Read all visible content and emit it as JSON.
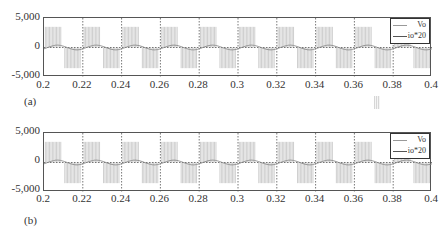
{
  "chart_data": [
    {
      "panel_label": "(a)",
      "type": "line",
      "title": "",
      "xlabel": "",
      "ylabel": "",
      "xlim": [
        0.2,
        0.4
      ],
      "ylim": [
        -5000,
        5000
      ],
      "x_ticks": [
        "0.2",
        "0.22",
        "0.24",
        "0.26",
        "0.28",
        "0.3",
        "0.32",
        "0.34",
        "0.36",
        "0.38",
        "0.4"
      ],
      "y_ticks": [
        "5,000",
        "0",
        "-5,000"
      ],
      "grid": "dotted vertical at each x tick, dotted horizontal at 0",
      "legend": [
        "Vo",
        "io*20"
      ],
      "legend_position": "top-right",
      "series": [
        {
          "name": "Vo",
          "description": "PWM square wave, period 0.02 s, +3500 for first half, -3500 for second half",
          "x": [
            0.2,
            0.21,
            0.21,
            0.22,
            0.22,
            0.23,
            0.23,
            0.24,
            0.24,
            0.25,
            0.25,
            0.26,
            0.26,
            0.27,
            0.27,
            0.28,
            0.28,
            0.29,
            0.29,
            0.3,
            0.3,
            0.31,
            0.31,
            0.32,
            0.32,
            0.33,
            0.33,
            0.34,
            0.34,
            0.35,
            0.35,
            0.36,
            0.36,
            0.37,
            0.37,
            0.38,
            0.38,
            0.39,
            0.39,
            0.4
          ],
          "values": [
            3500,
            3500,
            -3500,
            -3500,
            3500,
            3500,
            -3500,
            -3500,
            3500,
            3500,
            -3500,
            -3500,
            3500,
            3500,
            -3500,
            -3500,
            3500,
            3500,
            -3500,
            -3500,
            3500,
            3500,
            -3500,
            -3500,
            3500,
            3500,
            -3500,
            -3500,
            3500,
            3500,
            -3500,
            -3500,
            3500,
            3500,
            -3500,
            -3500,
            3500,
            3500,
            -3500,
            -3500
          ]
        },
        {
          "name": "io*20",
          "description": "sinusoid, amplitude ~400, period 0.02 s, lagging",
          "x": [
            0.2,
            0.205,
            0.21,
            0.215,
            0.22
          ],
          "values": [
            -200,
            300,
            400,
            -100,
            -400
          ]
        }
      ]
    },
    {
      "panel_label": "(b)",
      "type": "line",
      "title": "",
      "xlabel": "",
      "ylabel": "",
      "xlim": [
        0.2,
        0.4
      ],
      "ylim": [
        -5000,
        5000
      ],
      "x_ticks": [
        "0.2",
        "0.22",
        "0.24",
        "0.26",
        "0.28",
        "0.3",
        "0.32",
        "0.34",
        "0.36",
        "0.38",
        "0.4"
      ],
      "y_ticks": [
        "5,000",
        "0",
        "-5,000"
      ],
      "grid": "dotted vertical at each x tick, dotted horizontal at 0",
      "legend": [
        "Vo",
        "io*20"
      ],
      "legend_position": "top-right",
      "series": [
        {
          "name": "Vo",
          "description": "PWM square wave, period 0.02 s, +3500 / -3500",
          "x": [
            0.2,
            0.21,
            0.21,
            0.22
          ],
          "values": [
            3500,
            3500,
            -3500,
            -3500
          ]
        },
        {
          "name": "io*20",
          "description": "sinusoid, amplitude ~400, period 0.02 s",
          "x": [
            0.2,
            0.205,
            0.21,
            0.215,
            0.22
          ],
          "values": [
            -200,
            300,
            400,
            -100,
            -400
          ]
        }
      ]
    }
  ],
  "panels": [
    {
      "label": "(a)",
      "y_ticks": {
        "top": "5,000",
        "mid": "0",
        "bottom": "-5,000"
      },
      "x_ticks": [
        "0.2",
        "0.22",
        "0.24",
        "0.26",
        "0.28",
        "0.3",
        "0.32",
        "0.34",
        "0.36",
        "0.38",
        "0.4"
      ],
      "legend": {
        "vo": "Vo",
        "io": "io*20"
      },
      "colors": {
        "vo": "#c8c8c8",
        "io": "#888888",
        "grid": "#555555",
        "frame": "#555555"
      }
    },
    {
      "label": "(b)",
      "y_ticks": {
        "top": "5,000",
        "mid": "0",
        "bottom": "-5,000"
      },
      "x_ticks": [
        "0.2",
        "0.22",
        "0.24",
        "0.26",
        "0.28",
        "0.3",
        "0.32",
        "0.34",
        "0.36",
        "0.38",
        "0.4"
      ],
      "legend": {
        "vo": "Vo",
        "io": "io*20"
      },
      "colors": {
        "vo": "#c8c8c8",
        "io": "#888888",
        "grid": "#555555",
        "frame": "#555555"
      }
    }
  ]
}
